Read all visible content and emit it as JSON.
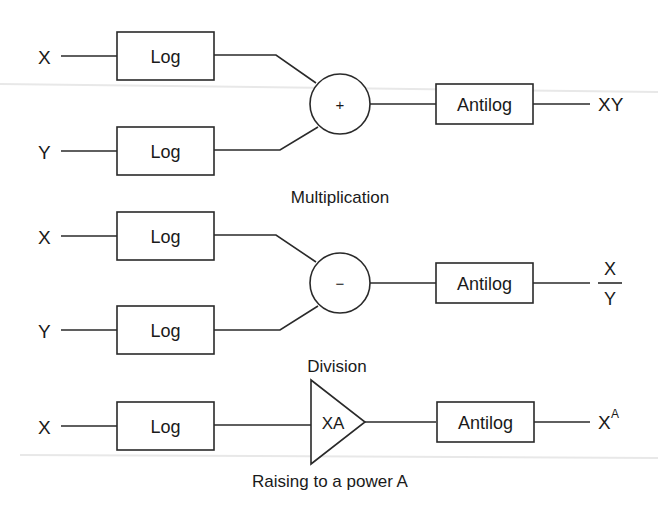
{
  "diagram": {
    "sections": [
      {
        "caption": "Multiplication",
        "inputs": [
          {
            "label": "X",
            "block": "Log"
          },
          {
            "label": "Y",
            "block": "Log"
          }
        ],
        "combiner": {
          "type": "summing-junction",
          "symbol": "+"
        },
        "output_block": "Antilog",
        "output_label": "XY"
      },
      {
        "caption": "Division",
        "inputs": [
          {
            "label": "X",
            "block": "Log"
          },
          {
            "label": "Y",
            "block": "Log"
          }
        ],
        "combiner": {
          "type": "summing-junction",
          "symbol": "−"
        },
        "output_block": "Antilog",
        "output_label": {
          "numerator": "X",
          "denominator": "Y"
        }
      },
      {
        "caption": "Raising to a power A",
        "inputs": [
          {
            "label": "X",
            "block": "Log"
          }
        ],
        "combiner": {
          "type": "amplifier",
          "symbol": "XA"
        },
        "output_block": "Antilog",
        "output_label": {
          "base": "X",
          "exponent": "A"
        }
      }
    ]
  }
}
